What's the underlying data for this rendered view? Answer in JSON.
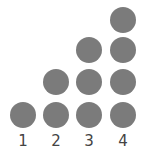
{
  "diagram": {
    "dot_color": "#7b7b7b",
    "columns": [
      {
        "label": "1",
        "count": 1
      },
      {
        "label": "2",
        "count": 2
      },
      {
        "label": "3",
        "count": 3
      },
      {
        "label": "4",
        "count": 4
      }
    ]
  }
}
